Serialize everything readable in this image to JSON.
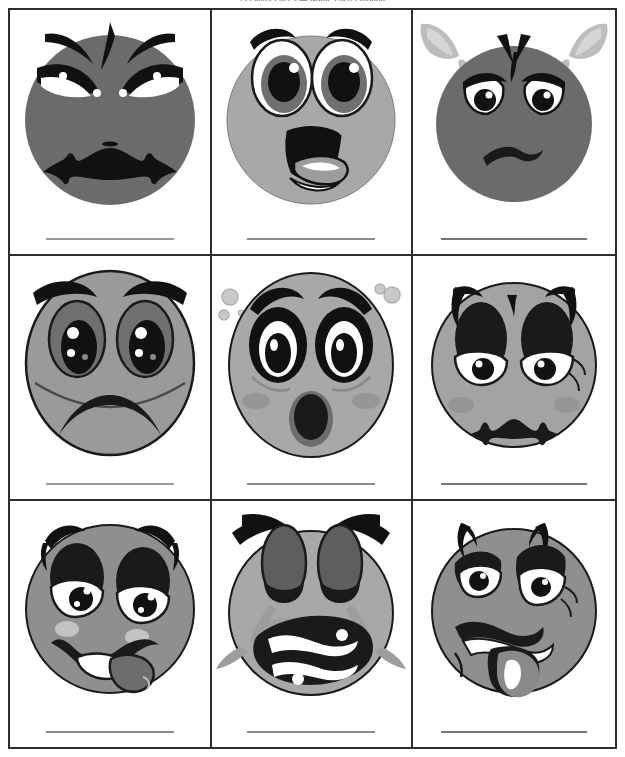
{
  "worksheet": {
    "title": "Feelings Faces — Name each emotion",
    "columns": 3,
    "rows": 3,
    "border_color": "#2f2f2f",
    "page_background": "#ffffff",
    "write_line_color": "#8c8c8c"
  },
  "palette": {
    "face_dark_gray": "#6b6b6b",
    "face_mid_gray": "#8f8f8f",
    "face_light_gray": "#a8a8a8",
    "outline_black": "#1a1a1a",
    "eye_white": "#ffffff",
    "tongue_gray": "#9a9a9a",
    "blush_gray": "#b7b7b7",
    "steam_gray": "#bdbdbd",
    "tear_gray": "#9d9d9d"
  },
  "cells": [
    {
      "index": 1,
      "icon_name": "angry-face-icon",
      "emotion": "Angry",
      "answer_line": "",
      "face_fill": "#6b6b6b",
      "features": "thick slanted eyebrows, narrowed black eyes, deep frown"
    },
    {
      "index": 2,
      "icon_name": "shocked-face-icon",
      "emotion": "Shocked",
      "answer_line": "",
      "face_fill": "#a8a8a8",
      "features": "wide oval eyes, raised brows, open mouth with tongue"
    },
    {
      "index": 3,
      "icon_name": "enraged-steaming-face-icon",
      "emotion": "Furious",
      "answer_line": "",
      "face_fill": "#6b6b6b",
      "features": "steam from ears, angled brows, small frown"
    },
    {
      "index": 4,
      "icon_name": "sad-face-icon",
      "emotion": "Sad",
      "answer_line": "",
      "face_fill": "#9a9a9a",
      "features": "drooping brows, large teary eyes, downturned mouth"
    },
    {
      "index": 5,
      "icon_name": "surprised-face-icon",
      "emotion": "Surprised",
      "answer_line": "",
      "face_fill": "#a8a8a8",
      "features": "raised brows, round eyes, small O mouth, bubbles"
    },
    {
      "index": 6,
      "icon_name": "tired-sad-face-icon",
      "emotion": "Tired",
      "answer_line": "",
      "face_fill": "#a3a3a3",
      "features": "heavy black eyelids, half-closed eyes, frown, blush"
    },
    {
      "index": 7,
      "icon_name": "silly-face-icon",
      "emotion": "Silly",
      "answer_line": "",
      "face_fill": "#8f8f8f",
      "features": "droopy lids, crooked smile, tongue out to the side"
    },
    {
      "index": 8,
      "icon_name": "crying-face-icon",
      "emotion": "Crying",
      "answer_line": "",
      "face_fill": "#a8a8a8",
      "features": "closed squeezed eyes, flying tears, gritted teeth"
    },
    {
      "index": 9,
      "icon_name": "sick-face-icon",
      "emotion": "Sick",
      "answer_line": "",
      "face_fill": "#8f8f8f",
      "features": "wavy mouth, tongue hanging out, queasy eyes"
    }
  ]
}
